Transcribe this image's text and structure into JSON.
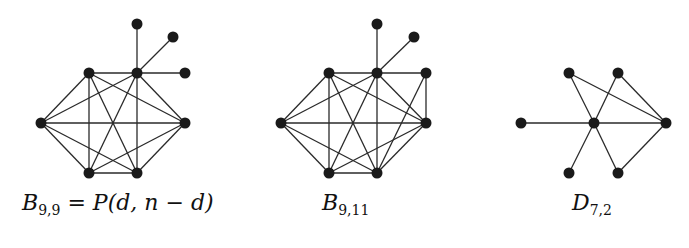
{
  "figure": {
    "graphs": [
      {
        "id": "B99",
        "label": {
          "main": "B",
          "sub": "9,9",
          "rest_eq": " = ",
          "rest_P": "P",
          "rest_args": "(d, n − d)"
        },
        "nodes": [
          [
            137,
            24
          ],
          [
            173,
            37
          ],
          [
            89,
            73
          ],
          [
            137,
            73
          ],
          [
            185,
            73
          ],
          [
            41,
            123
          ],
          [
            185,
            123
          ],
          [
            89,
            173
          ],
          [
            137,
            173
          ]
        ],
        "edges": [
          [
            0,
            3
          ],
          [
            1,
            3
          ],
          [
            4,
            3
          ],
          [
            2,
            3
          ],
          [
            2,
            5
          ],
          [
            2,
            6
          ],
          [
            2,
            7
          ],
          [
            2,
            8
          ],
          [
            3,
            5
          ],
          [
            3,
            6
          ],
          [
            3,
            7
          ],
          [
            3,
            8
          ],
          [
            5,
            6
          ],
          [
            5,
            7
          ],
          [
            5,
            8
          ],
          [
            6,
            7
          ],
          [
            6,
            8
          ],
          [
            7,
            8
          ]
        ]
      },
      {
        "id": "B911",
        "label": {
          "main": "B",
          "sub": "9,11"
        },
        "nodes": [
          [
            377,
            24
          ],
          [
            414,
            37
          ],
          [
            329,
            73
          ],
          [
            377,
            73
          ],
          [
            426,
            73
          ],
          [
            281,
            123
          ],
          [
            426,
            123
          ],
          [
            329,
            173
          ],
          [
            377,
            173
          ]
        ],
        "edges": [
          [
            0,
            3
          ],
          [
            1,
            3
          ],
          [
            2,
            3
          ],
          [
            3,
            4
          ],
          [
            4,
            6
          ],
          [
            4,
            8
          ],
          [
            2,
            5
          ],
          [
            2,
            6
          ],
          [
            2,
            7
          ],
          [
            2,
            8
          ],
          [
            3,
            5
          ],
          [
            3,
            6
          ],
          [
            3,
            7
          ],
          [
            3,
            8
          ],
          [
            5,
            6
          ],
          [
            5,
            7
          ],
          [
            5,
            8
          ],
          [
            6,
            7
          ],
          [
            6,
            8
          ],
          [
            7,
            8
          ]
        ]
      },
      {
        "id": "D72",
        "label": {
          "main": "D",
          "sub": "7,2"
        },
        "nodes": [
          [
            569,
            73
          ],
          [
            618,
            73
          ],
          [
            521,
            123
          ],
          [
            594,
            123
          ],
          [
            666,
            123
          ],
          [
            569,
            173
          ],
          [
            618,
            173
          ]
        ],
        "edges": [
          [
            2,
            3
          ],
          [
            3,
            4
          ],
          [
            0,
            3
          ],
          [
            0,
            4
          ],
          [
            1,
            3
          ],
          [
            1,
            4
          ],
          [
            5,
            3
          ],
          [
            6,
            3
          ],
          [
            6,
            4
          ]
        ]
      }
    ]
  }
}
